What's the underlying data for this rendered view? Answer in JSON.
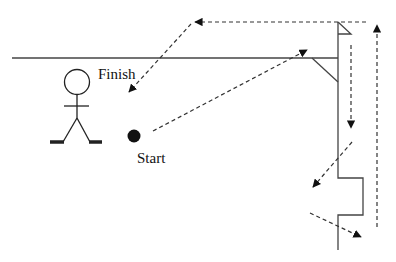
{
  "diagram": {
    "type": "path-diagram",
    "labels": {
      "start": "Start",
      "finish": "Finish"
    },
    "nodes": [
      {
        "id": "person",
        "kind": "stick-figure"
      },
      {
        "id": "start",
        "kind": "filled-dot",
        "label": "Start"
      },
      {
        "id": "finish",
        "kind": "arrow-target",
        "label": "Finish"
      }
    ],
    "colors": {
      "line": "#333333",
      "dashed": "#333333",
      "background": "#ffffff"
    },
    "route_order": [
      "Start → up-right toward wall corner",
      "down along inner wall",
      "down-left away from wall",
      "down-right past notch",
      "up along outer dashed line",
      "left along top",
      "down-left to Finish"
    ]
  }
}
